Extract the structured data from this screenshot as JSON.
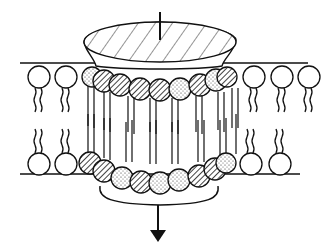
{
  "diagram": {
    "type": "membrane-channel-illustration",
    "style": "black-and-white line drawing",
    "colors": {
      "ink": "#111111",
      "background": "#ffffff"
    },
    "membrane": {
      "top_line_y": 69,
      "bottom_line_y": 174,
      "left_lipids_top": [
        {
          "cx": 42,
          "cy": 77
        },
        {
          "cx": 66,
          "cy": 77
        }
      ],
      "right_lipids_top": [
        {
          "cx": 253,
          "cy": 77
        },
        {
          "cx": 281,
          "cy": 77
        },
        {
          "cx": 309,
          "cy": 77
        }
      ],
      "left_lipids_bottom": [
        {
          "cx": 40,
          "cy": 165
        },
        {
          "cx": 67,
          "cy": 165
        }
      ],
      "right_lipids_bottom": [
        {
          "cx": 250,
          "cy": 165
        },
        {
          "cx": 280,
          "cy": 165
        }
      ]
    },
    "channel": {
      "cap": "hatched conical cap",
      "top_ring_heads": [
        "stippled",
        "hatched",
        "hatched",
        "hatched",
        "hatched",
        "stippled",
        "hatched",
        "stippled",
        "hatched"
      ],
      "bottom_ring_heads": [
        "hatched",
        "hatched",
        "stippled",
        "hatched",
        "stippled",
        "stippled",
        "hatched",
        "hatched",
        "stippled"
      ],
      "arrow_direction": "down"
    }
  }
}
